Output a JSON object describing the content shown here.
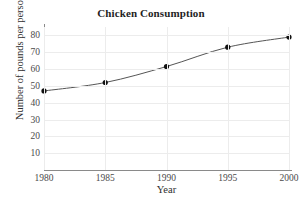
{
  "chart_data": {
    "type": "line",
    "title": "Chicken Consumption",
    "xlabel": "Year",
    "ylabel": "Number of pounds per person",
    "x": [
      1980,
      1985,
      1990,
      1995,
      2000
    ],
    "values": [
      47,
      52,
      61.5,
      73,
      79
    ],
    "series": [
      {
        "name": "Chicken consumption",
        "values": [
          47,
          52,
          61.5,
          73,
          79
        ]
      }
    ],
    "xlim": [
      1980,
      2000
    ],
    "ylim": [
      0,
      85
    ],
    "x_ticks": [
      1980,
      1985,
      1990,
      1995,
      2000
    ],
    "x_tick_labels": [
      "1980",
      "1985",
      "1990",
      "1995",
      "2000"
    ],
    "y_ticks": [
      10,
      20,
      30,
      40,
      50,
      60,
      70,
      80
    ],
    "y_tick_labels": [
      "10",
      "20",
      "30",
      "40",
      "50",
      "60",
      "70",
      "80"
    ],
    "grid": true,
    "legend": false,
    "legend_position": "none",
    "marker": "circle",
    "colors": {
      "line": "#555555",
      "marker": "#111111",
      "grid": "#ececec",
      "axis": "#8a8a8a",
      "background": "#ffffff",
      "text": "#2e2e2e"
    }
  }
}
